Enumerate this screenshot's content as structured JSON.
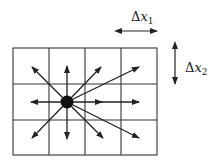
{
  "diagram": {
    "labels": {
      "dx1": {
        "delta": "Δ",
        "var": "x",
        "sub": "1"
      },
      "dx2": {
        "delta": "Δ",
        "var": "x",
        "sub": "2"
      }
    },
    "grid": {
      "columns": 4,
      "rows": 3
    },
    "center_node": {
      "column": 1,
      "row": 1
    },
    "arrows": [
      {
        "to": "upper-left"
      },
      {
        "to": "up"
      },
      {
        "to": "upper-right"
      },
      {
        "to": "upper-right-far"
      },
      {
        "to": "left"
      },
      {
        "to": "right"
      },
      {
        "to": "right-far"
      },
      {
        "to": "lower-left"
      },
      {
        "to": "down"
      },
      {
        "to": "lower-right"
      },
      {
        "to": "lower-right-far"
      }
    ],
    "colors": {
      "line": "#222222",
      "background": "#ffffff"
    }
  }
}
